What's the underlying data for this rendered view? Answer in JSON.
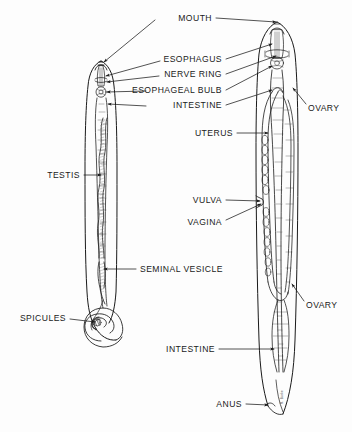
{
  "figure": {
    "background_color": "#fdfdfd",
    "ink_color": "#1a1a1a",
    "width": 352,
    "height": 432,
    "signature": "R. Burke"
  },
  "labels": [
    {
      "id": "mouth",
      "text": "MOUTH",
      "x": 212,
      "y": 18,
      "align": "r"
    },
    {
      "id": "esophagus",
      "text": "ESOPHAGUS",
      "x": 222,
      "y": 59,
      "align": "r"
    },
    {
      "id": "nerve-ring",
      "text": "NERVE RING",
      "x": 222,
      "y": 74,
      "align": "r"
    },
    {
      "id": "esophageal-bulb",
      "text": "ESOPHAGEAL BULB",
      "x": 222,
      "y": 90,
      "align": "r"
    },
    {
      "id": "intestine-upper",
      "text": "INTESTINE",
      "x": 222,
      "y": 105,
      "align": "r"
    },
    {
      "id": "uterus",
      "text": "UTERUS",
      "x": 233,
      "y": 133,
      "align": "r"
    },
    {
      "id": "ovary-upper",
      "text": "OVARY",
      "x": 308,
      "y": 108,
      "align": "l"
    },
    {
      "id": "testis",
      "text": "TESTIS",
      "x": 80,
      "y": 175,
      "align": "r"
    },
    {
      "id": "vulva",
      "text": "VULVA",
      "x": 222,
      "y": 200,
      "align": "r"
    },
    {
      "id": "vagina",
      "text": "VAGINA",
      "x": 222,
      "y": 222,
      "align": "r"
    },
    {
      "id": "seminal-vesicle",
      "text": "SEMINAL VESICLE",
      "x": 140,
      "y": 269,
      "align": "l"
    },
    {
      "id": "ovary-lower",
      "text": "OVARY",
      "x": 306,
      "y": 305,
      "align": "l"
    },
    {
      "id": "spicules",
      "text": "SPICULES",
      "x": 66,
      "y": 318,
      "align": "r"
    },
    {
      "id": "intestine-lower",
      "text": "INTESTINE",
      "x": 215,
      "y": 349,
      "align": "r"
    },
    {
      "id": "anus",
      "text": "ANUS",
      "x": 242,
      "y": 404,
      "align": "r"
    }
  ],
  "specimens": [
    {
      "id": "male",
      "sex": "male",
      "organs": [
        "mouth",
        "esophagus",
        "nerve ring",
        "esophageal bulb",
        "intestine",
        "testis",
        "seminal vesicle",
        "spicules"
      ]
    },
    {
      "id": "female",
      "sex": "female",
      "organs": [
        "mouth",
        "esophagus",
        "nerve ring",
        "esophageal bulb",
        "intestine",
        "ovary",
        "uterus",
        "vulva",
        "vagina",
        "anus"
      ]
    }
  ]
}
